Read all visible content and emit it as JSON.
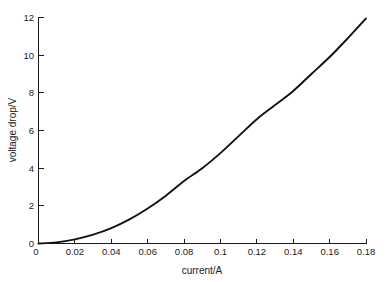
{
  "chart_data": {
    "type": "line",
    "title": "",
    "xlabel": "current/A",
    "ylabel": "voltage drop/V",
    "xlim": [
      0,
      0.18
    ],
    "ylim": [
      0,
      12
    ],
    "grid": false,
    "legend": null,
    "xticks": [
      0,
      0.02,
      0.04,
      0.06,
      0.08,
      0.1,
      0.12,
      0.14,
      0.16,
      0.18
    ],
    "xtick_labels": [
      "0",
      "0.02",
      "0.04",
      "0.06",
      "0.08",
      "0.1",
      "0.12",
      "0.14",
      "0.16",
      "0.18"
    ],
    "yticks": [
      0,
      2,
      4,
      6,
      8,
      10,
      12
    ],
    "ytick_labels": [
      "0",
      "2",
      "4",
      "6",
      "8",
      "10",
      "12"
    ],
    "series": [
      {
        "name": "voltage drop vs current",
        "color": "#111111",
        "x": [
          0,
          0.01,
          0.02,
          0.03,
          0.04,
          0.05,
          0.06,
          0.07,
          0.08,
          0.09,
          0.1,
          0.11,
          0.12,
          0.13,
          0.14,
          0.15,
          0.16,
          0.17,
          0.18
        ],
        "y": [
          0,
          0.06,
          0.22,
          0.47,
          0.82,
          1.28,
          1.86,
          2.54,
          3.32,
          4.0,
          4.8,
          5.7,
          6.6,
          7.35,
          8.1,
          9.0,
          9.9,
          10.9,
          11.95
        ]
      }
    ],
    "annotations": []
  },
  "figure": {
    "name": "voltage-drop-vs-current-plot",
    "background": "#ffffff",
    "axis_color": "#1a1a1a"
  }
}
